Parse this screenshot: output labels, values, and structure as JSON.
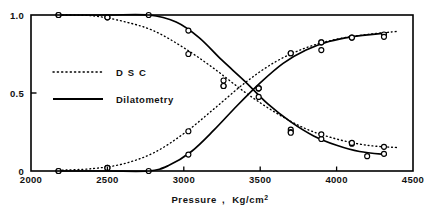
{
  "chart_data": {
    "type": "line",
    "title": "",
    "xlabel": "Pressure ,  Kg/cm2",
    "xlabel_main": "Pressure",
    "xlabel_comma": ",",
    "xlabel_unit_base": "Kg/cm",
    "xlabel_unit_exp": "2",
    "ylabel": "",
    "xlim": [
      2000,
      4500
    ],
    "ylim": [
      0,
      1.0
    ],
    "xticks": [
      2000,
      2500,
      3000,
      3500,
      4000,
      4500
    ],
    "xtick_labels": [
      "2000",
      "2500",
      "3000",
      "3500",
      "4000",
      "4500"
    ],
    "yticks": [
      0,
      0.5,
      1.0
    ],
    "ytick_labels": [
      "0",
      "0.5",
      "1.0"
    ],
    "grid": false,
    "legend_position": "upper-left-inside",
    "legend": [
      {
        "name": "DSC",
        "label": "D S C",
        "style": "dotted"
      },
      {
        "name": "Dilatometry",
        "label": "Dilatometry",
        "style": "solid"
      }
    ],
    "series": [
      {
        "name": "DSC decreasing",
        "label": "DSC",
        "style": "dotted",
        "marker": "open-circle",
        "points": [
          {
            "x": 2180,
            "y": 1.0
          },
          {
            "x": 2500,
            "y": 0.985
          },
          {
            "x": 3030,
            "y": 0.75
          },
          {
            "x": 3260,
            "y": 0.58
          },
          {
            "x": 3260,
            "y": 0.545
          },
          {
            "x": 3700,
            "y": 0.265
          },
          {
            "x": 3700,
            "y": 0.25
          },
          {
            "x": 3900,
            "y": 0.205
          },
          {
            "x": 4100,
            "y": 0.175
          },
          {
            "x": 4310,
            "y": 0.155
          }
        ],
        "curve": [
          {
            "x": 2180,
            "y": 1.0
          },
          {
            "x": 2400,
            "y": 0.995
          },
          {
            "x": 2600,
            "y": 0.96
          },
          {
            "x": 2800,
            "y": 0.9
          },
          {
            "x": 3000,
            "y": 0.79
          },
          {
            "x": 3200,
            "y": 0.655
          },
          {
            "x": 3400,
            "y": 0.505
          },
          {
            "x": 3600,
            "y": 0.375
          },
          {
            "x": 3800,
            "y": 0.27
          },
          {
            "x": 4000,
            "y": 0.205
          },
          {
            "x": 4200,
            "y": 0.165
          },
          {
            "x": 4400,
            "y": 0.15
          }
        ]
      },
      {
        "name": "DSC increasing",
        "label": "DSC",
        "style": "dotted",
        "marker": "open-circle",
        "points": [
          {
            "x": 2180,
            "y": 0.0
          },
          {
            "x": 2500,
            "y": 0.02
          },
          {
            "x": 3030,
            "y": 0.255
          },
          {
            "x": 3260,
            "y": 0.545
          },
          {
            "x": 3490,
            "y": 0.53
          },
          {
            "x": 3700,
            "y": 0.755
          },
          {
            "x": 3900,
            "y": 0.825
          },
          {
            "x": 4100,
            "y": 0.855
          },
          {
            "x": 4310,
            "y": 0.875
          }
        ],
        "curve": [
          {
            "x": 2180,
            "y": 0.005
          },
          {
            "x": 2400,
            "y": 0.015
          },
          {
            "x": 2600,
            "y": 0.045
          },
          {
            "x": 2800,
            "y": 0.115
          },
          {
            "x": 3000,
            "y": 0.24
          },
          {
            "x": 3200,
            "y": 0.4
          },
          {
            "x": 3400,
            "y": 0.565
          },
          {
            "x": 3600,
            "y": 0.7
          },
          {
            "x": 3800,
            "y": 0.79
          },
          {
            "x": 4000,
            "y": 0.845
          },
          {
            "x": 4200,
            "y": 0.875
          },
          {
            "x": 4400,
            "y": 0.895
          }
        ]
      },
      {
        "name": "Dilatometry decreasing",
        "label": "Dilatometry",
        "style": "solid",
        "marker": "open-circle",
        "points": [
          {
            "x": 2180,
            "y": 1.0
          },
          {
            "x": 2500,
            "y": 0.985
          },
          {
            "x": 2770,
            "y": 1.0
          },
          {
            "x": 3030,
            "y": 0.9
          },
          {
            "x": 3490,
            "y": 0.53
          },
          {
            "x": 3490,
            "y": 0.475
          },
          {
            "x": 3700,
            "y": 0.245
          },
          {
            "x": 3900,
            "y": 0.235
          },
          {
            "x": 4100,
            "y": 0.18
          },
          {
            "x": 4200,
            "y": 0.095
          },
          {
            "x": 4310,
            "y": 0.11
          }
        ],
        "curve": [
          {
            "x": 2180,
            "y": 1.0
          },
          {
            "x": 2500,
            "y": 1.0
          },
          {
            "x": 2770,
            "y": 1.0
          },
          {
            "x": 2950,
            "y": 0.955
          },
          {
            "x": 3100,
            "y": 0.855
          },
          {
            "x": 3250,
            "y": 0.71
          },
          {
            "x": 3400,
            "y": 0.575
          },
          {
            "x": 3550,
            "y": 0.43
          },
          {
            "x": 3700,
            "y": 0.315
          },
          {
            "x": 3850,
            "y": 0.225
          },
          {
            "x": 4000,
            "y": 0.165
          },
          {
            "x": 4150,
            "y": 0.125
          },
          {
            "x": 4330,
            "y": 0.105
          }
        ]
      },
      {
        "name": "Dilatometry increasing",
        "label": "Dilatometry",
        "style": "solid",
        "marker": "open-circle",
        "points": [
          {
            "x": 2180,
            "y": 0.0
          },
          {
            "x": 2500,
            "y": 0.02
          },
          {
            "x": 2770,
            "y": 0.0
          },
          {
            "x": 3030,
            "y": 0.105
          },
          {
            "x": 3490,
            "y": 0.53
          },
          {
            "x": 3700,
            "y": 0.755
          },
          {
            "x": 3900,
            "y": 0.825
          },
          {
            "x": 3900,
            "y": 0.775
          },
          {
            "x": 4100,
            "y": 0.855
          },
          {
            "x": 4310,
            "y": 0.86
          }
        ],
        "curve": [
          {
            "x": 2180,
            "y": 0.0
          },
          {
            "x": 2500,
            "y": 0.0
          },
          {
            "x": 2770,
            "y": 0.0
          },
          {
            "x": 2900,
            "y": 0.035
          },
          {
            "x": 3050,
            "y": 0.125
          },
          {
            "x": 3200,
            "y": 0.265
          },
          {
            "x": 3350,
            "y": 0.42
          },
          {
            "x": 3500,
            "y": 0.565
          },
          {
            "x": 3650,
            "y": 0.69
          },
          {
            "x": 3800,
            "y": 0.775
          },
          {
            "x": 3950,
            "y": 0.83
          },
          {
            "x": 4100,
            "y": 0.86
          },
          {
            "x": 4330,
            "y": 0.885
          }
        ]
      }
    ],
    "colors": {
      "line": "#000000",
      "axis": "#000000",
      "background": "#ffffff",
      "marker_fill": "#ffffff"
    }
  }
}
